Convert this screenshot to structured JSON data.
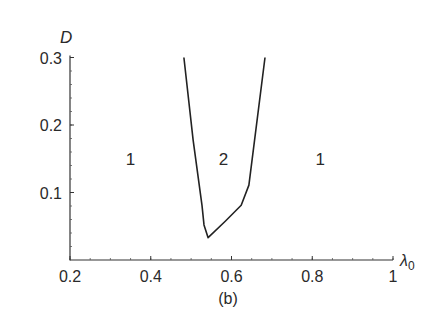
{
  "chart_data": {
    "type": "line",
    "title": "",
    "caption": "(b)",
    "xlabel": "λ0",
    "ylabel": "D",
    "xlim": [
      0.2,
      1.0
    ],
    "ylim": [
      0.0,
      0.3
    ],
    "xticks": [
      0.2,
      0.4,
      0.6,
      0.8,
      1.0
    ],
    "xtick_labels": [
      "0.2",
      "0.4",
      "0.6",
      "0.8",
      "1"
    ],
    "yticks": [
      0.1,
      0.2,
      0.3
    ],
    "ytick_labels": [
      "0.1",
      "0.2",
      "0.3"
    ],
    "grid": false,
    "legend": null,
    "series": [
      {
        "name": "boundary",
        "color": "#222222",
        "x": [
          0.482,
          0.505,
          0.527,
          0.532,
          0.542,
          0.584,
          0.624,
          0.643,
          0.683
        ],
        "y": [
          0.3,
          0.178,
          0.081,
          0.052,
          0.033,
          0.057,
          0.081,
          0.111,
          0.3
        ]
      }
    ],
    "annotations": [
      {
        "text": "1",
        "x": 0.35,
        "y": 0.15
      },
      {
        "text": "2",
        "x": 0.58,
        "y": 0.15
      },
      {
        "text": "1",
        "x": 0.82,
        "y": 0.15
      }
    ]
  }
}
